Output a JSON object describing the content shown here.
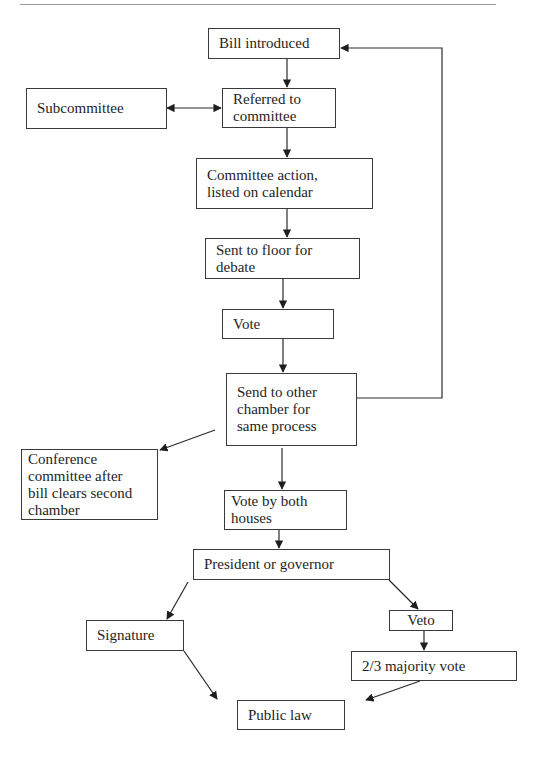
{
  "diagram": {
    "type": "flowchart",
    "nodes": [
      {
        "id": "bill_introduced",
        "label": "Bill introduced"
      },
      {
        "id": "subcommittee",
        "label": "Subcommittee"
      },
      {
        "id": "referred",
        "label": "Referred to\ncommittee"
      },
      {
        "id": "committee_action",
        "label": "Committee action,\nlisted on calendar"
      },
      {
        "id": "sent_floor",
        "label": "Sent to floor for\ndebate"
      },
      {
        "id": "vote",
        "label": "Vote"
      },
      {
        "id": "send_other",
        "label": "Send to other\nchamber for\nsame process"
      },
      {
        "id": "conference",
        "label": "Conference\ncommittee after\nbill clears second\nchamber"
      },
      {
        "id": "vote_both",
        "label": "Vote by both\nhouses"
      },
      {
        "id": "president",
        "label": "President or governor"
      },
      {
        "id": "signature",
        "label": "Signature"
      },
      {
        "id": "veto",
        "label": "Veto"
      },
      {
        "id": "majority",
        "label": "2/3 majority vote"
      },
      {
        "id": "public_law",
        "label": "Public law"
      }
    ],
    "edges": [
      {
        "from": "bill_introduced",
        "to": "referred"
      },
      {
        "from": "subcommittee",
        "to": "referred",
        "bidirectional": true
      },
      {
        "from": "referred",
        "to": "committee_action"
      },
      {
        "from": "committee_action",
        "to": "sent_floor"
      },
      {
        "from": "sent_floor",
        "to": "vote"
      },
      {
        "from": "vote",
        "to": "send_other"
      },
      {
        "from": "send_other",
        "to": "bill_introduced"
      },
      {
        "from": "send_other",
        "to": "conference"
      },
      {
        "from": "send_other",
        "to": "vote_both"
      },
      {
        "from": "vote_both",
        "to": "president"
      },
      {
        "from": "president",
        "to": "signature"
      },
      {
        "from": "president",
        "to": "veto"
      },
      {
        "from": "veto",
        "to": "majority"
      },
      {
        "from": "signature",
        "to": "public_law"
      },
      {
        "from": "majority",
        "to": "public_law"
      }
    ]
  }
}
